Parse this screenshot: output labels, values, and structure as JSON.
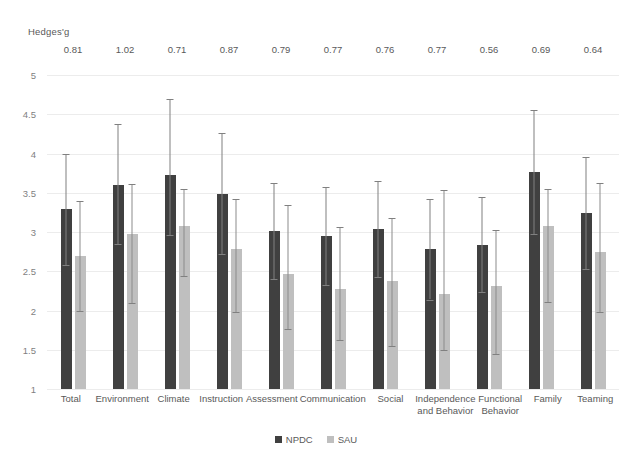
{
  "chart_data": {
    "type": "bar",
    "title": "",
    "ylabel": "Hedges'g",
    "xlabel": "",
    "ylim": [
      1,
      5
    ],
    "ytick_labels": [
      "5",
      "4.5",
      "4",
      "3.5",
      "3",
      "2.5",
      "2",
      "1.5",
      "1"
    ],
    "yticks": [
      5,
      4.5,
      4,
      3.5,
      3,
      2.5,
      2,
      1.5,
      1
    ],
    "grid": true,
    "legend_position": "bottom",
    "categories": [
      "Total",
      "Environment",
      "Climate",
      "Instruction",
      "Assessment",
      "Communication",
      "Social",
      "Independence and Behavior",
      "Functional Behavior",
      "Family",
      "Teaming"
    ],
    "annotations": {
      "label": "Hedges'g",
      "values": [
        "0.81",
        "1.02",
        "0.71",
        "0.87",
        "0.79",
        "0.77",
        "0.76",
        "0.77",
        "0.56",
        "0.69",
        "0.64"
      ]
    },
    "series": [
      {
        "name": "NPDC",
        "color": "#404040",
        "values": [
          3.29,
          3.6,
          3.73,
          3.49,
          3.01,
          2.95,
          3.04,
          2.78,
          2.84,
          3.76,
          3.24
        ],
        "err_low": [
          2.58,
          2.85,
          2.96,
          2.72,
          2.4,
          2.33,
          2.43,
          2.14,
          2.24,
          2.97,
          2.53
        ],
        "err_high": [
          4.0,
          4.38,
          4.7,
          4.26,
          3.62,
          3.57,
          3.65,
          3.42,
          3.44,
          4.55,
          3.95
        ]
      },
      {
        "name": "SAU",
        "color": "#bfbfbf",
        "values": [
          2.69,
          2.97,
          3.08,
          2.79,
          2.46,
          2.28,
          2.37,
          2.21,
          2.31,
          3.08,
          2.74
        ],
        "err_low": [
          1.99,
          2.09,
          2.44,
          1.98,
          1.77,
          1.63,
          1.55,
          1.5,
          1.44,
          2.11,
          1.98
        ],
        "err_high": [
          3.4,
          3.61,
          3.55,
          3.42,
          3.35,
          3.07,
          3.18,
          3.53,
          3.03,
          3.55,
          3.62
        ]
      }
    ]
  },
  "legend": {
    "items": [
      {
        "label": "NPDC",
        "color": "#404040"
      },
      {
        "label": "SAU",
        "color": "#bfbfbf"
      }
    ]
  }
}
